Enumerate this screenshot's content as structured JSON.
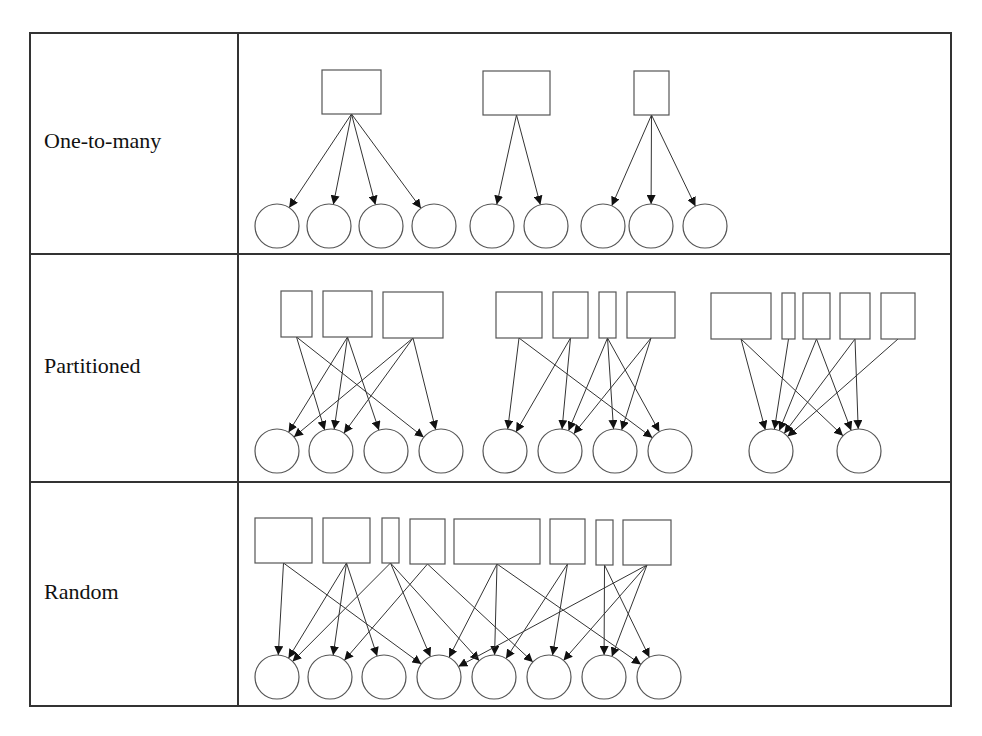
{
  "table": {
    "x": 30,
    "y": 33,
    "width": 921,
    "height": 673,
    "col_divider_x": 238,
    "row_dividers_y": [
      254,
      482
    ],
    "rows": [
      {
        "label": "One-to-many",
        "label_y": 148
      },
      {
        "label": "Partitioned",
        "label_y": 373
      },
      {
        "label": "Random",
        "label_y": 599
      }
    ]
  },
  "diagrams": {
    "one_to_many": {
      "circle_y": 226,
      "circle_r": 22,
      "rects": [
        {
          "x": 322,
          "y": 70,
          "w": 59,
          "h": 44
        },
        {
          "x": 483,
          "y": 71,
          "w": 67,
          "h": 44
        },
        {
          "x": 634,
          "y": 71,
          "w": 35,
          "h": 44
        }
      ],
      "circles": [
        277,
        329,
        381,
        434,
        492,
        546,
        603,
        651,
        705
      ],
      "edges": [
        [
          0,
          0
        ],
        [
          0,
          1
        ],
        [
          0,
          2
        ],
        [
          0,
          3
        ],
        [
          1,
          4
        ],
        [
          1,
          5
        ],
        [
          2,
          6
        ],
        [
          2,
          7
        ],
        [
          2,
          8
        ]
      ]
    },
    "partitioned": {
      "circle_y": 451,
      "circle_r": 22,
      "rects": [
        {
          "x": 281,
          "y": 291,
          "w": 31,
          "h": 46
        },
        {
          "x": 323,
          "y": 291,
          "w": 49,
          "h": 46
        },
        {
          "x": 383,
          "y": 292,
          "w": 60,
          "h": 46
        },
        {
          "x": 496,
          "y": 292,
          "w": 46,
          "h": 46
        },
        {
          "x": 553,
          "y": 292,
          "w": 35,
          "h": 46
        },
        {
          "x": 599,
          "y": 292,
          "w": 17,
          "h": 46
        },
        {
          "x": 627,
          "y": 292,
          "w": 48,
          "h": 46
        },
        {
          "x": 711,
          "y": 293,
          "w": 60,
          "h": 46
        },
        {
          "x": 782,
          "y": 293,
          "w": 13,
          "h": 46
        },
        {
          "x": 803,
          "y": 293,
          "w": 27,
          "h": 46
        },
        {
          "x": 840,
          "y": 293,
          "w": 30,
          "h": 46
        },
        {
          "x": 881,
          "y": 293,
          "w": 34,
          "h": 46
        }
      ],
      "circles": [
        277,
        331,
        386,
        441,
        505,
        560,
        615,
        670,
        771,
        859
      ],
      "edges": [
        [
          0,
          1
        ],
        [
          0,
          3
        ],
        [
          1,
          0
        ],
        [
          1,
          1
        ],
        [
          1,
          2
        ],
        [
          2,
          0
        ],
        [
          2,
          1
        ],
        [
          2,
          3
        ],
        [
          3,
          4
        ],
        [
          3,
          7
        ],
        [
          4,
          4
        ],
        [
          4,
          5
        ],
        [
          5,
          5
        ],
        [
          5,
          6
        ],
        [
          5,
          7
        ],
        [
          6,
          5
        ],
        [
          6,
          6
        ],
        [
          7,
          8
        ],
        [
          7,
          9
        ],
        [
          8,
          8
        ],
        [
          9,
          8
        ],
        [
          9,
          9
        ],
        [
          10,
          8
        ],
        [
          10,
          9
        ],
        [
          11,
          8
        ]
      ]
    },
    "random": {
      "circle_y": 677,
      "circle_r": 22,
      "rects": [
        {
          "x": 255,
          "y": 518,
          "w": 57,
          "h": 45
        },
        {
          "x": 323,
          "y": 518,
          "w": 47,
          "h": 45
        },
        {
          "x": 382,
          "y": 518,
          "w": 17,
          "h": 45
        },
        {
          "x": 410,
          "y": 519,
          "w": 35,
          "h": 45
        },
        {
          "x": 454,
          "y": 519,
          "w": 86,
          "h": 45
        },
        {
          "x": 550,
          "y": 519,
          "w": 35,
          "h": 45
        },
        {
          "x": 596,
          "y": 520,
          "w": 17,
          "h": 45
        },
        {
          "x": 623,
          "y": 520,
          "w": 48,
          "h": 45
        }
      ],
      "circles": [
        277,
        330,
        384,
        439,
        494,
        549,
        604,
        659
      ],
      "edges": [
        [
          0,
          0
        ],
        [
          0,
          3
        ],
        [
          1,
          0
        ],
        [
          1,
          1
        ],
        [
          1,
          2
        ],
        [
          2,
          0
        ],
        [
          2,
          3
        ],
        [
          2,
          4
        ],
        [
          3,
          1
        ],
        [
          3,
          5
        ],
        [
          4,
          3
        ],
        [
          4,
          4
        ],
        [
          4,
          7
        ],
        [
          5,
          4
        ],
        [
          5,
          5
        ],
        [
          6,
          6
        ],
        [
          6,
          7
        ],
        [
          7,
          3
        ],
        [
          7,
          5
        ],
        [
          7,
          6
        ]
      ]
    }
  }
}
